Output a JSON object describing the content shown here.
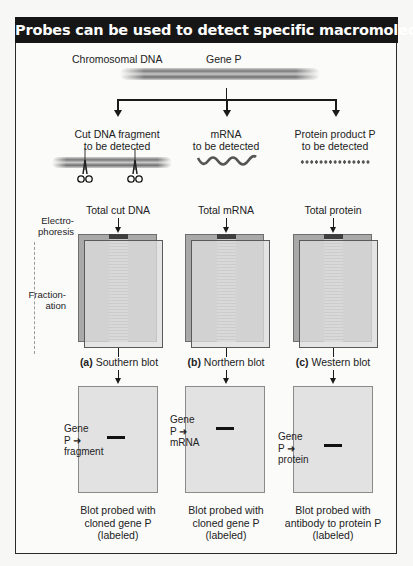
{
  "title": "Probes can be used to detect specific macromolecules",
  "top": {
    "chromosomal_dna_label": "Chromosomal DNA",
    "gene_label": "Gene P"
  },
  "targets": [
    {
      "line1": "Cut DNA fragment",
      "line2": "to be detected",
      "icon": "dna-fragment-with-scissors-icon"
    },
    {
      "line1": "mRNA",
      "line2": "to be detected",
      "icon": "mrna-wave-icon"
    },
    {
      "line1": "Protein product P",
      "line2": "to be detected",
      "icon": "protein-bead-chain-icon"
    }
  ],
  "side_labels": {
    "electrophoresis": [
      "Electro-",
      "phoresis"
    ],
    "fractionation": [
      "Fraction-",
      "ation"
    ]
  },
  "columns": [
    {
      "sample": "Total cut DNA",
      "letter": "(a)",
      "blot_name": "Southern blot",
      "band_label": [
        "Gene",
        "P",
        "fragment"
      ],
      "caption": [
        "Blot probed with",
        "cloned gene P",
        "(labeled)"
      ]
    },
    {
      "sample": "Total mRNA",
      "letter": "(b)",
      "blot_name": "Northern blot",
      "band_label": [
        "Gene",
        "P",
        "mRNA"
      ],
      "caption": [
        "Blot probed with",
        "cloned gene P",
        "(labeled)"
      ]
    },
    {
      "sample": "Total protein",
      "letter": "(c)",
      "blot_name": "Western blot",
      "band_label": [
        "Gene",
        "P",
        "protein"
      ],
      "caption": [
        "Blot probed with",
        "antibody to protein P",
        "(labeled)"
      ]
    }
  ],
  "colors": {
    "header_bg": "#161616",
    "header_text": "#ffffff",
    "gel_back": "#a9a9a9",
    "gel_front": "#dedede",
    "blot": "#e2e2e2",
    "band": "#111111"
  }
}
